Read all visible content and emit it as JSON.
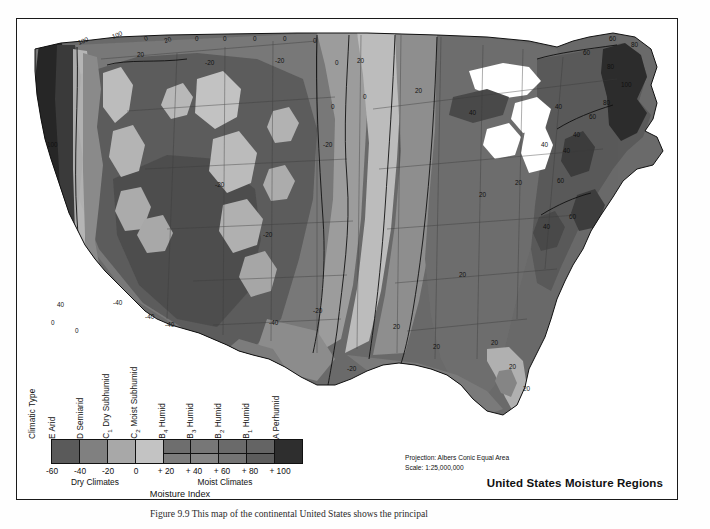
{
  "figure": {
    "title": "United States Moisture Regions",
    "projection_note_line1": "Projection: Albers Conic Equal Area",
    "projection_note_line2": "Scale: 1:25,000,000",
    "caption": "Figure 9.9   This map of the continental United States shows the principal"
  },
  "legend": {
    "axis_title": "Moisture Index",
    "climatic_type_header": "Climatic Type",
    "classes": [
      {
        "code": "E",
        "sub": "",
        "name": "Arid",
        "label": "E Arid",
        "color_top": "#5a5a5a",
        "color_bottom": "#5a5a5a"
      },
      {
        "code": "D",
        "sub": "",
        "name": "Semiarid",
        "label": "D Semiarid",
        "color_top": "#808080",
        "color_bottom": "#808080"
      },
      {
        "code": "C",
        "sub": "1",
        "name": "Dry Subhumid",
        "label": "C1 Dry Subhumid",
        "color_top": "#a8a8a8",
        "color_bottom": "#a8a8a8"
      },
      {
        "code": "C",
        "sub": "2",
        "name": "Moist Subhumid",
        "label": "C2 Moist Subhumid",
        "color_top": "#c3c3c3",
        "color_bottom": "#c3c3c3"
      },
      {
        "code": "B",
        "sub": "4",
        "name": "Humid",
        "label": "B4 Humid",
        "color_top": "#6e6e6e",
        "color_bottom": "#7d7d7d"
      },
      {
        "code": "B",
        "sub": "3",
        "name": "Humid",
        "label": "B3 Humid",
        "color_top": "#777777",
        "color_bottom": "#868686"
      },
      {
        "code": "B",
        "sub": "2",
        "name": "Humid",
        "label": "B2 Humid",
        "color_top": "#6a6a6a",
        "color_bottom": "#747474"
      },
      {
        "code": "B",
        "sub": "1",
        "name": "Humid",
        "label": "B1 Humid",
        "color_top": "#646464",
        "color_bottom": "#5c5c5c"
      },
      {
        "code": "A",
        "sub": "",
        "name": "Perhumid",
        "label": "A Perhumid",
        "color_top": "#2e2e2e",
        "color_bottom": "#2e2e2e"
      }
    ],
    "scale_ticks": [
      "-60",
      "-40",
      "-20",
      "0",
      "+ 20",
      "+ 40",
      "+ 60",
      "+ 80",
      "+ 100"
    ],
    "group_dry": "Dry Climates",
    "group_moist": "Moist Climates"
  },
  "map": {
    "region_name": "United States Moisture Regions",
    "contour_labels": [
      "100",
      "100",
      "0",
      "20",
      "0",
      "0",
      "0",
      "0",
      "0",
      "0",
      "0",
      "100",
      "40",
      "0",
      "0",
      "-20",
      "-20",
      "-20",
      "-20",
      "-20",
      "0",
      "20",
      "40",
      "20",
      "20",
      "20",
      "40",
      "60",
      "80",
      "100",
      "80",
      "60",
      "60",
      "40",
      "40",
      "40",
      "-40",
      "-40",
      "-40",
      "-40",
      "-40",
      "-20",
      "20",
      "20",
      "20",
      "20",
      "20",
      "40",
      "60",
      "80",
      "80",
      "100",
      "60"
    ]
  }
}
